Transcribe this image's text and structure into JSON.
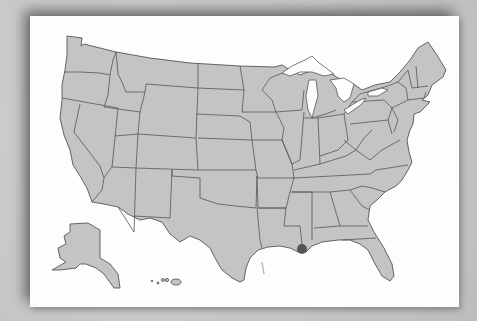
{
  "map": {
    "title": "United States states map",
    "region": "United States",
    "insets": [
      "Alaska",
      "Hawaii"
    ],
    "fill_color": "#c4c4c4",
    "border_color": "#555555",
    "card_color": "#fdfdfd",
    "background_color": "#c9c9c9"
  },
  "marker": {
    "location": "New Orleans, Louisiana",
    "color": "#555555"
  }
}
